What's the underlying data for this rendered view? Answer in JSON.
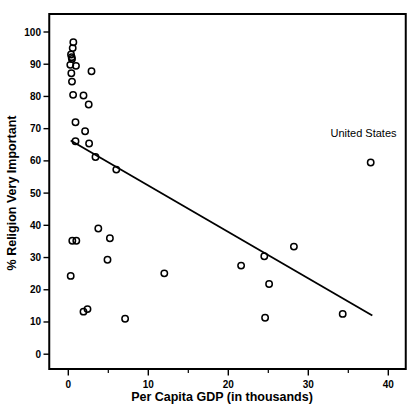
{
  "figure": {
    "background": "#ffffff",
    "ink_color": "#000000"
  },
  "chart_data": {
    "type": "scatter",
    "title": "",
    "xlabel": "Per Capita GDP (in thousands)",
    "ylabel": "% Religion Very Important",
    "xlim": [
      -2.4,
      42.2
    ],
    "ylim": [
      -4.6,
      105.6
    ],
    "grid": false,
    "legend": "none",
    "marker": "open-circle",
    "x_major_ticks": [
      0,
      10,
      20,
      30,
      40
    ],
    "x_minor_ticks": [
      5,
      15,
      25,
      35
    ],
    "y_major_ticks": [
      0,
      10,
      20,
      30,
      40,
      50,
      60,
      70,
      80,
      90,
      100
    ],
    "points": [
      [
        0.63,
        96.8
      ],
      [
        0.55,
        95.0
      ],
      [
        0.34,
        93.0
      ],
      [
        0.42,
        92.2
      ],
      [
        0.46,
        91.6
      ],
      [
        0.25,
        89.8
      ],
      [
        0.96,
        89.5
      ],
      [
        2.9,
        87.8
      ],
      [
        0.38,
        87.2
      ],
      [
        0.46,
        84.6
      ],
      [
        0.6,
        80.5
      ],
      [
        1.9,
        80.3
      ],
      [
        2.55,
        77.5
      ],
      [
        0.9,
        72.0
      ],
      [
        2.1,
        69.2
      ],
      [
        0.9,
        66.1
      ],
      [
        2.6,
        65.4
      ],
      [
        3.4,
        61.2
      ],
      [
        6.0,
        57.3
      ],
      [
        3.75,
        39.0
      ],
      [
        5.2,
        36.0
      ],
      [
        0.5,
        35.2
      ],
      [
        1.0,
        35.2
      ],
      [
        4.9,
        29.3
      ],
      [
        0.3,
        24.3
      ],
      [
        12.0,
        25.1
      ],
      [
        1.9,
        13.2
      ],
      [
        2.4,
        14.0
      ],
      [
        7.1,
        11.0
      ],
      [
        21.6,
        27.5
      ],
      [
        24.5,
        30.4
      ],
      [
        28.2,
        33.4
      ],
      [
        25.1,
        21.8
      ],
      [
        24.6,
        11.3
      ],
      [
        34.3,
        12.5
      ],
      [
        37.8,
        59.5
      ]
    ],
    "trend_line": {
      "x1": 0.3,
      "y1": 66.3,
      "x2": 38.0,
      "y2": 12.0
    },
    "annotations": [
      {
        "text": "United States",
        "x": 36.9,
        "y": 67.5,
        "anchor": "middle"
      }
    ]
  }
}
